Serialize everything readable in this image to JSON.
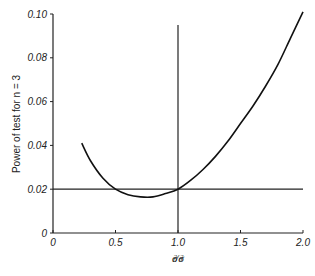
{
  "chart_data": {
    "type": "line",
    "title": "",
    "xlabel": "σ1²/σ0²",
    "ylabel": "Power of test for n = 3",
    "xlim": [
      0,
      2.0
    ],
    "ylim": [
      0,
      0.1
    ],
    "grid": false,
    "legend": null,
    "x_ticks": [
      "0",
      "0.5",
      "1.0",
      "1.5",
      "2.0"
    ],
    "y_ticks": [
      "0",
      "0.02",
      "0.04",
      "0.06",
      "0.08",
      "0.10"
    ],
    "series": [
      {
        "name": "Power curve",
        "x": [
          0.23,
          0.3,
          0.4,
          0.5,
          0.6,
          0.7,
          0.8,
          0.9,
          1.0,
          1.1,
          1.2,
          1.3,
          1.4,
          1.5,
          1.6,
          1.7,
          1.8,
          1.9,
          2.0
        ],
        "y": [
          0.041,
          0.033,
          0.025,
          0.02,
          0.0175,
          0.0165,
          0.0165,
          0.018,
          0.02,
          0.024,
          0.029,
          0.035,
          0.042,
          0.05,
          0.058,
          0.067,
          0.077,
          0.089,
          0.101
        ]
      }
    ],
    "reference_lines": [
      {
        "orientation": "horizontal",
        "y": 0.02
      },
      {
        "orientation": "vertical",
        "x": 1.0,
        "y_top": 0.095
      }
    ]
  }
}
